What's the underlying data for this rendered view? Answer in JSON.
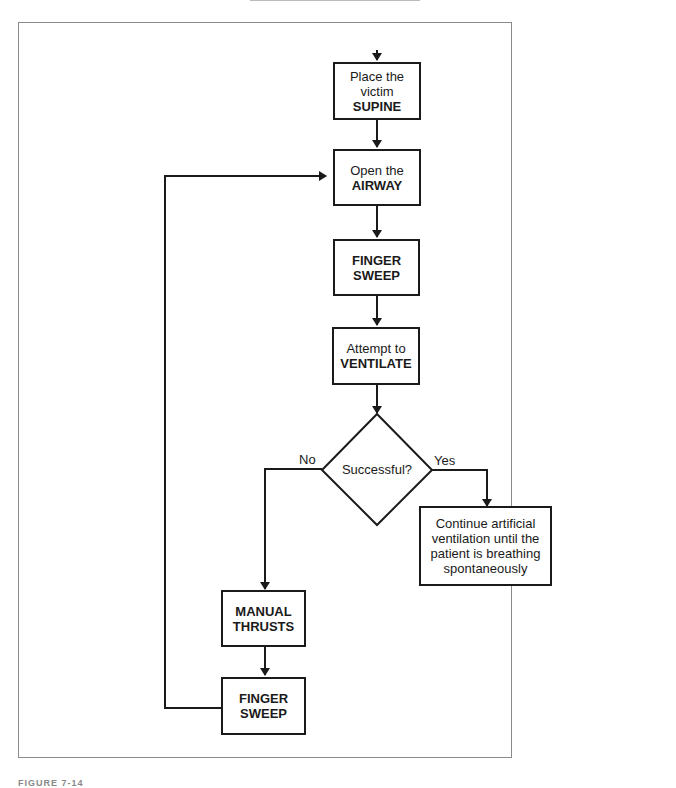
{
  "diagram": {
    "type": "flowchart",
    "nodes": [
      {
        "id": "supine",
        "line1": "Place the",
        "line2": "victim",
        "bold": "SUPINE"
      },
      {
        "id": "airway",
        "line1": "Open the",
        "bold": "AIRWAY"
      },
      {
        "id": "sweep1",
        "bold1": "FINGER",
        "bold2": "SWEEP"
      },
      {
        "id": "ventilate",
        "line1": "Attempt to",
        "bold": "VENTILATE"
      },
      {
        "id": "decision",
        "label": "Successful?"
      },
      {
        "id": "continue",
        "lines": [
          "Continue artificial",
          "ventilation until the",
          "patient is breathing",
          "spontaneously"
        ]
      },
      {
        "id": "thrusts",
        "bold1": "MANUAL",
        "bold2": "THRUSTS"
      },
      {
        "id": "sweep2",
        "bold1": "FINGER",
        "bold2": "SWEEP"
      }
    ],
    "edge_labels": {
      "no": "No",
      "yes": "Yes"
    },
    "caption": "FIGURE 7-14"
  },
  "colors": {
    "line": "#1a1a1a",
    "frame": "#8a8a8a"
  }
}
